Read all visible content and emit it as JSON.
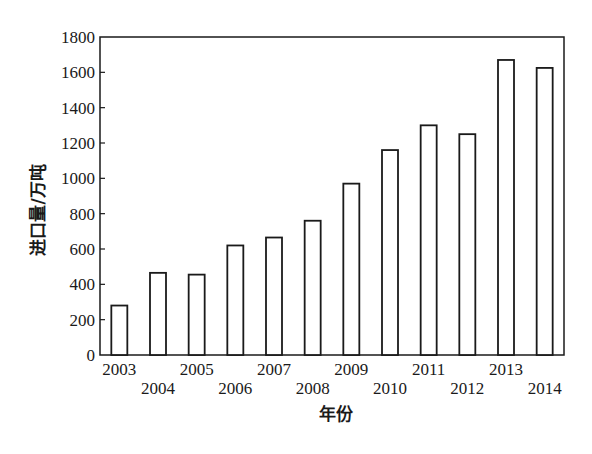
{
  "chart_data": {
    "type": "bar",
    "title": "",
    "xlabel": "年份",
    "ylabel": "进口量/万吨",
    "categories": [
      "2003",
      "2004",
      "2005",
      "2006",
      "2007",
      "2008",
      "2009",
      "2010",
      "2011",
      "2012",
      "2013",
      "2014"
    ],
    "values": [
      280,
      465,
      455,
      620,
      665,
      760,
      970,
      1160,
      1300,
      1250,
      1670,
      1625
    ],
    "ylim": [
      0,
      1800
    ],
    "yticks": [
      0,
      200,
      400,
      600,
      800,
      1000,
      1200,
      1400,
      1600,
      1800
    ],
    "grid": false,
    "legend": null,
    "bar_style": {
      "fill": "#ffffff",
      "stroke": "#1a1a1a"
    },
    "x_label_staggered": true
  }
}
